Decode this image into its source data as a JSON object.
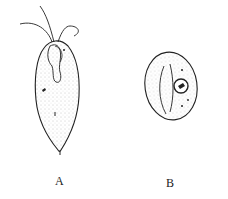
{
  "figure": {
    "panels": [
      {
        "id": "A",
        "label": "A",
        "description": "flagellate trophozoite (pear-shaped, with anterior flagella, cytostome and pointed posterior)"
      },
      {
        "id": "B",
        "label": "B",
        "description": "oval cyst with nucleus and curved fibrils"
      }
    ]
  },
  "colors": {
    "ink": "#222222",
    "stipple": "#8a8a8a",
    "background": "#ffffff"
  }
}
